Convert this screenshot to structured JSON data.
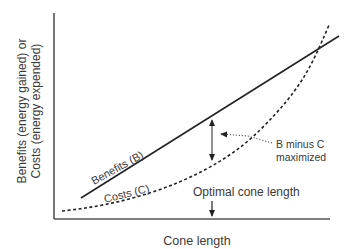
{
  "diagram": {
    "y_axis_label_line1": "Benefits (energy gained) or",
    "y_axis_label_line2": "Costs (energy expended)",
    "x_axis_label": "Cone length",
    "benefits_label": "Benefits (B)",
    "costs_label": "Costs (C)",
    "annotation_line1": "B minus C",
    "annotation_line2": "maximized",
    "optimal_label": "Optimal cone length",
    "colors": {
      "axis": "#555555",
      "line": "#222222",
      "text": "#3a3a3a"
    }
  }
}
